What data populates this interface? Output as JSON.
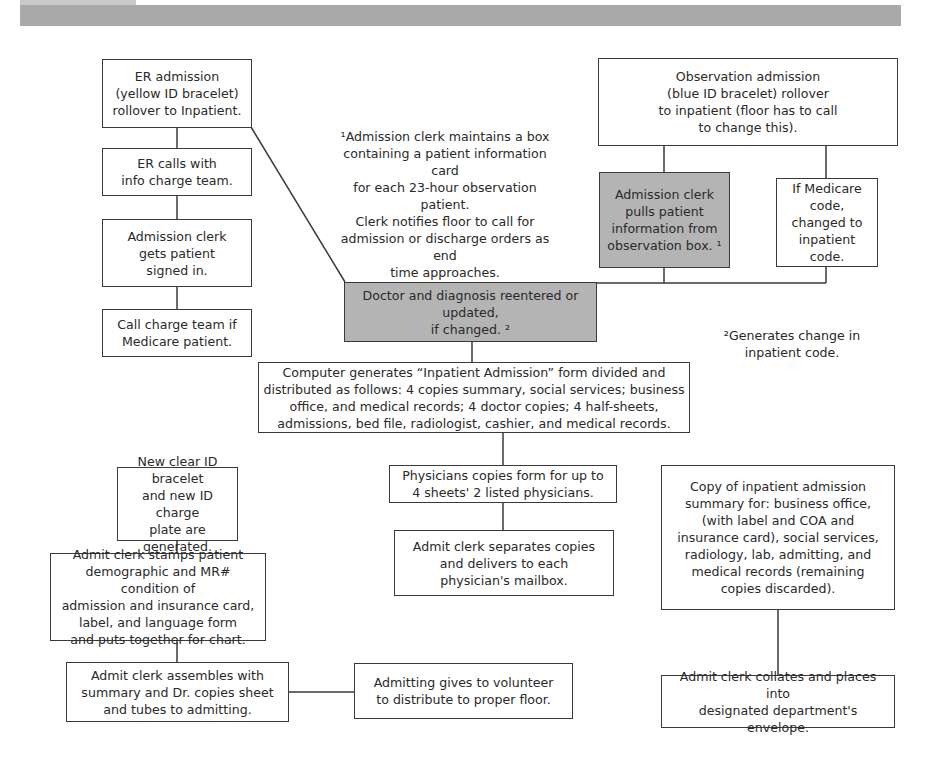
{
  "header": {
    "bar_color": "#a9a9a9",
    "tab_color": "#c9c9c9"
  },
  "colors": {
    "box_border": "#3a3a3a",
    "box_fill": "#ffffff",
    "shaded_fill": "#b4b4b4",
    "text": "#2a2a2a"
  },
  "left_column": {
    "er_admission": "ER admission\n(yellow ID bracelet)\nrollover to Inpatient.",
    "er_calls": "ER calls with\ninfo charge team.",
    "clerk_signs_in": "Admission clerk\ngets patient\nsigned in.",
    "call_charge_team": "Call charge team if\nMedicare patient."
  },
  "notes": {
    "footnote_1": "¹Admission clerk maintains a box\ncontaining a patient information card\nfor each 23-hour observation patient.\nClerk notifies floor to call for\nadmission or discharge orders as end\ntime approaches.",
    "footnote_2": "²Generates change in\ninpatient code."
  },
  "right_column": {
    "observation_admission": "Observation admission\n(blue ID bracelet) rollover\nto inpatient (floor has to call\nto change this).",
    "clerk_pulls_info": "Admission clerk\npulls patient\ninformation from\nobservation box. ¹",
    "medicare_code": "If Medicare\ncode,\nchanged to\ninpatient code."
  },
  "center": {
    "doctor_diagnosis": "Doctor and diagnosis reentered or updated,\nif changed. ²",
    "computer_generates": "Computer generates “Inpatient Admission” form divided and\ndistributed as follows: 4 copies summary, social services; business\noffice, and medical records; 4 doctor copies; 4 half-sheets,\nadmissions, bed file, radiologist, cashier, and medical records."
  },
  "bottom_left": {
    "new_bracelet": "New clear ID bracelet\nand new ID charge\nplate are generated.",
    "clerk_stamps": "Admit clerk stamps patient\ndemographic and MR# condition of\nadmission and insurance card,\nlabel, and language form\nand puts together for chart.",
    "clerk_assembles": "Admit clerk assembles with\nsummary and Dr. copies sheet\nand tubes to admitting.",
    "admitting_volunteer": "Admitting gives to volunteer\nto distribute to proper floor."
  },
  "bottom_center": {
    "physician_copies": "Physicians copies form for up to\n4 sheets' 2 listed physicians.",
    "clerk_separates": "Admit clerk separates copies\nand delivers to each\nphysician's mailbox."
  },
  "bottom_right": {
    "copy_summary": "Copy of inpatient admission\nsummary for: business office,\n(with label and COA and\ninsurance card), social services,\nradiology, lab, admitting, and\nmedical records (remaining\ncopies discarded).",
    "clerk_collates": "Admit clerk collates and places into\ndesignated department's envelope."
  }
}
